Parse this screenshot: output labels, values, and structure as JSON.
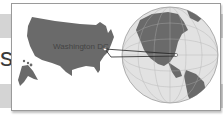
{
  "illustration": {
    "label": "Washington DC",
    "partial_letter": "s",
    "colors": {
      "land": "#6a6a6a",
      "ocean": "#e2e2e2",
      "band": "#d4d4d4",
      "frame_border": "#9a9a9a"
    }
  }
}
